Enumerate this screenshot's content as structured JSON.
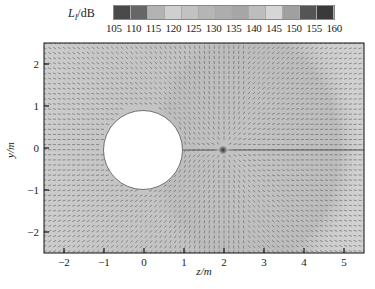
{
  "chart_data": {
    "type": "heatmap",
    "subtype": "acoustic-intensity-vector-field",
    "title": "",
    "colorbar": {
      "label_main": "L",
      "label_sub": "I",
      "label_unit": "/dB",
      "ticks": [
        "105",
        "110",
        "115",
        "120",
        "125",
        "130",
        "135",
        "140",
        "145",
        "150",
        "155",
        "160"
      ],
      "colors": [
        "#4a4a4a",
        "#666666",
        "#b3b3b3",
        "#cfcfcf",
        "#c2c2c2",
        "#b5b5b5",
        "#adadad",
        "#a6a6a6",
        "#bdbdbd",
        "#d6d6d6",
        "#a0a0a0",
        "#555555",
        "#3a3a3a"
      ]
    },
    "xlabel": "z/m",
    "ylabel": "y/m",
    "xlim": [
      -2.5,
      5.5
    ],
    "ylim": [
      -2.5,
      2.5
    ],
    "xticks": [
      -2,
      -1,
      0,
      1,
      2,
      3,
      4,
      5
    ],
    "yticks": [
      -2,
      -1,
      0,
      1,
      2
    ],
    "scatterer": {
      "shape": "circle",
      "center": [
        0,
        0
      ],
      "radius": 1.0,
      "fill": "#ffffff"
    },
    "source": {
      "z": 2.0,
      "y": 0.0
    },
    "regions": [
      {
        "description": "near-source lobe",
        "center": [
          2.0,
          0.0
        ],
        "radius": 1.3,
        "level_db": 140
      },
      {
        "description": "far field right",
        "z_from": 2.5,
        "level_db": 130
      },
      {
        "description": "shadow / left of scatterer",
        "z_to": -1.0,
        "level_db": 120
      }
    ],
    "vectors": "radial intensity arrows emanating from source at (2,0) and diffracting around circular scatterer; parallel horizontal arrows near y=0 to the right"
  },
  "axes": {
    "xlabel": "z/m",
    "ylabel": "y/m",
    "xtick_labels": [
      "−2",
      "−1",
      "0",
      "1",
      "2",
      "3",
      "4",
      "5"
    ],
    "ytick_labels": [
      "2",
      "1",
      "0",
      "−1",
      "−2"
    ]
  }
}
